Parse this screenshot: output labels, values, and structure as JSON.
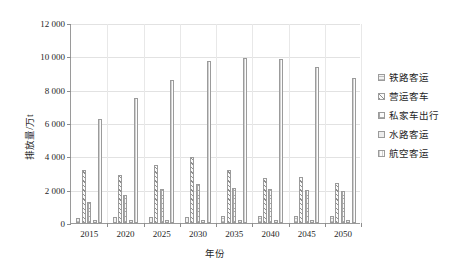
{
  "chart_data": {
    "type": "bar",
    "title": "",
    "xlabel": "年份",
    "ylabel": "排放量/万t",
    "categories": [
      "2015",
      "2020",
      "2025",
      "2030",
      "2035",
      "2040",
      "2045",
      "2050"
    ],
    "ylim": [
      0,
      12000
    ],
    "yticks": [
      0,
      2000,
      4000,
      6000,
      8000,
      10000,
      12000
    ],
    "ytick_labels": [
      "0",
      "2 000",
      "4 000",
      "6 000",
      "8 000",
      "10 000",
      "12 000"
    ],
    "grid": true,
    "legend_position": "right",
    "series": [
      {
        "name": "铁路客运",
        "pattern": "horizontal-lines",
        "values": [
          330,
          350,
          370,
          390,
          400,
          400,
          400,
          410
        ]
      },
      {
        "name": "营运客车",
        "pattern": "diagonal-hatch",
        "values": [
          3180,
          2900,
          3500,
          3950,
          3200,
          2700,
          2750,
          2400
        ]
      },
      {
        "name": "私家车出行",
        "pattern": "grid-crosshatch",
        "values": [
          1280,
          1680,
          2040,
          2320,
          2130,
          2020,
          1960,
          1900
        ]
      },
      {
        "name": "水路客运",
        "pattern": "fine-horizontal",
        "values": [
          160,
          170,
          180,
          190,
          190,
          190,
          190,
          190
        ]
      },
      {
        "name": "航空客运",
        "pattern": "vertical-lines",
        "values": [
          6250,
          7480,
          8570,
          9740,
          9880,
          9840,
          9340,
          8690
        ]
      }
    ]
  },
  "legend": {
    "items": [
      {
        "label": "铁路客运"
      },
      {
        "label": "营运客车"
      },
      {
        "label": "私家车出行"
      },
      {
        "label": "水路客运"
      },
      {
        "label": "航空客运"
      }
    ]
  }
}
